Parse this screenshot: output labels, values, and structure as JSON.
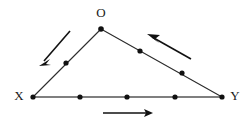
{
  "figure": {
    "background_color": "#ffffff",
    "width": 249,
    "height": 127,
    "line_color": "#2b2b2b",
    "base_line_color": "#555555",
    "dot_color": "#111111",
    "arrow_color": "#111111",
    "label_color": "#1a1a1a"
  },
  "labels": {
    "apex": "O",
    "left": "X",
    "right": "Y"
  },
  "label_positions": {
    "apex": {
      "x": 101,
      "y": 14
    },
    "left": {
      "x": 19,
      "y": 97
    },
    "right": {
      "x": 235,
      "y": 97
    }
  },
  "vertices": {
    "O": {
      "x": 101,
      "y": 29
    },
    "X": {
      "x": 33,
      "y": 97
    },
    "Y": {
      "x": 222,
      "y": 97
    }
  },
  "edges": [
    {
      "name": "edge-O-X",
      "from": "O",
      "to": "X",
      "style": "thin"
    },
    {
      "name": "edge-O-Y",
      "from": "O",
      "to": "Y",
      "style": "thin"
    },
    {
      "name": "edge-X-Y",
      "from": "X",
      "to": "Y",
      "style": "base"
    }
  ],
  "points": {
    "on_base_XY": [
      {
        "x": 33,
        "y": 97,
        "is_vertex": true
      },
      {
        "x": 80,
        "y": 97,
        "is_vertex": false
      },
      {
        "x": 127,
        "y": 97,
        "is_vertex": false
      },
      {
        "x": 175,
        "y": 97,
        "is_vertex": false
      },
      {
        "x": 222,
        "y": 97,
        "is_vertex": true
      }
    ],
    "on_edge_OX": [
      {
        "x": 66,
        "y": 63,
        "is_vertex": false
      }
    ],
    "on_edge_OY": [
      {
        "x": 140,
        "y": 51,
        "is_vertex": false
      },
      {
        "x": 182,
        "y": 73,
        "is_vertex": false
      }
    ],
    "apex_dot": {
      "x": 101,
      "y": 29
    }
  },
  "arrows": [
    {
      "name": "arrow-down-left",
      "description": "arrow pointing down-left alongside edge OX",
      "tail": {
        "x": 70,
        "y": 31
      },
      "head": {
        "x": 39,
        "y": 66
      }
    },
    {
      "name": "arrow-up-left",
      "description": "arrow pointing up-left alongside edge OY",
      "tail": {
        "x": 191,
        "y": 59
      },
      "head": {
        "x": 147,
        "y": 34
      }
    },
    {
      "name": "arrow-right",
      "description": "arrow pointing right below base XY",
      "tail": {
        "x": 103,
        "y": 113
      },
      "head": {
        "x": 153,
        "y": 113
      }
    }
  ]
}
